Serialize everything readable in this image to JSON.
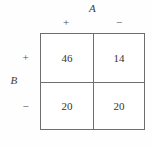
{
  "figure": {
    "type": "contingency-table",
    "column_variable": "A",
    "row_variable": "B",
    "column_headers": [
      "+",
      "−"
    ],
    "row_headers": [
      "+",
      "−"
    ],
    "cells": [
      [
        "46",
        "14"
      ],
      [
        "20",
        "20"
      ]
    ],
    "colors": {
      "background": "#fefefe",
      "border": "#6e6e6e",
      "text": "#333333",
      "label_text": "#3d3d3d"
    }
  },
  "chart_data": {
    "type": "table",
    "title": "",
    "xlabel": "A",
    "ylabel": "B",
    "categories": [
      "+",
      "−"
    ],
    "row_categories": [
      "+",
      "−"
    ],
    "values": [
      [
        46,
        14
      ],
      [
        20,
        20
      ]
    ],
    "series": [
      {
        "name": "B = +",
        "values": [
          46,
          14
        ]
      },
      {
        "name": "B = −",
        "values": [
          20,
          20
        ]
      }
    ],
    "grid": true,
    "legend": "none"
  }
}
